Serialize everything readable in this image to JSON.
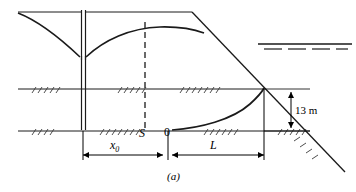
{
  "figure": {
    "caption": "(a)",
    "labels": {
      "seepage_point": "S",
      "origin": "0",
      "distance_x0": "x",
      "distance_x0_sub": "0",
      "length_l": "L",
      "head_dimension": "13 m"
    },
    "colors": {
      "line": "#1a1a1a",
      "background": "#ffffff"
    },
    "elements": {
      "well": "vertical-well-casing",
      "phreatic_surface_left": "drawdown-curve-left",
      "phreatic_surface_right": "drawdown-curve-right",
      "seepage_face_curve": "seepage-curve",
      "slope_line": "embankment-slope",
      "water_table_symbol": "water-table-marker",
      "hatching": "ground-hatch-marks",
      "section_line": "dashed-section-line"
    }
  }
}
